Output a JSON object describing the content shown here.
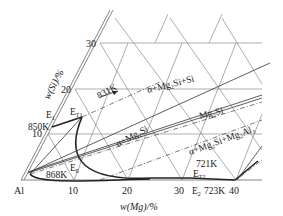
{
  "diagram": {
    "type": "ternary-phase-diagram-section",
    "system": "Al-Mg-Si",
    "corner_label": "Al",
    "x_axis": {
      "label": "w(Mg)/%",
      "ticks": [
        "10",
        "20",
        "30",
        "40"
      ]
    },
    "y_axis": {
      "label": "w(Si)/%",
      "ticks": [
        "10",
        "20",
        "30"
      ]
    },
    "points": {
      "E1": "E1",
      "E_T1": "E",
      "E_T1_sub": "T1",
      "E0": "E",
      "E0_sub": "0",
      "E2": "E",
      "E2_sub": "2",
      "E_T2": "E",
      "E_T2_sub": "T2"
    },
    "temperatures": {
      "t850": "850K",
      "t831": "831K",
      "t868": "868K",
      "t721": "721K",
      "t723": "723K"
    },
    "phase_regions": {
      "a_mg2si_si": "α+Mg₂Si+Si",
      "mg2si": "Mg₂Si",
      "a_mg2si": "α+Mg₂Si",
      "a_mg2si_mg2al3": "α+Mg₂Si+Mg₂Al₃"
    },
    "e1_label": "E",
    "e1_sub": "1"
  }
}
